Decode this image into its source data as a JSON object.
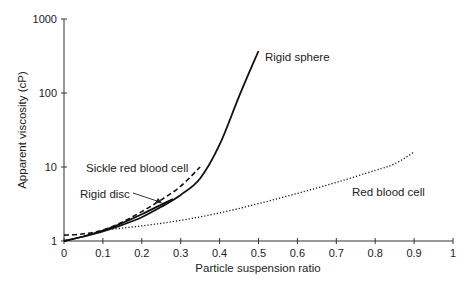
{
  "chart_data": {
    "type": "line",
    "title": "",
    "xlabel": "Particle suspension ratio",
    "ylabel": "Apparent viscosity (cP)",
    "xlim": [
      0,
      1
    ],
    "ylim": [
      1,
      1000
    ],
    "yscale": "log",
    "grid": false,
    "legend": "inline annotations",
    "x_ticks": [
      "0",
      "0.1",
      "0.2",
      "0.3",
      "0.4",
      "0.5",
      "0.6",
      "0.7",
      "0.8",
      "0.9",
      "1"
    ],
    "y_ticks": [
      "1",
      "10",
      "100",
      "1000"
    ],
    "series": [
      {
        "name": "Rigid sphere",
        "style": "solid",
        "x": [
          0,
          0.05,
          0.1,
          0.15,
          0.2,
          0.25,
          0.3,
          0.35,
          0.4,
          0.45,
          0.5
        ],
        "y": [
          1.0,
          1.15,
          1.35,
          1.65,
          2.1,
          2.9,
          4.2,
          7.0,
          20,
          90,
          370
        ]
      },
      {
        "name": "Rigid disc",
        "style": "solid",
        "x": [
          0,
          0.05,
          0.1,
          0.15,
          0.2,
          0.25,
          0.28
        ],
        "y": [
          1.0,
          1.15,
          1.38,
          1.75,
          2.3,
          3.1,
          3.7
        ]
      },
      {
        "name": "Sickle red blood cell",
        "style": "dashed",
        "x": [
          0,
          0.05,
          0.1,
          0.15,
          0.2,
          0.25,
          0.3,
          0.35
        ],
        "y": [
          1.2,
          1.25,
          1.4,
          1.8,
          2.5,
          3.6,
          5.5,
          10
        ]
      },
      {
        "name": "Red blood cell",
        "style": "dotted",
        "x": [
          0.1,
          0.2,
          0.3,
          0.4,
          0.5,
          0.6,
          0.7,
          0.8,
          0.85,
          0.9
        ],
        "y": [
          1.4,
          1.6,
          1.9,
          2.4,
          3.2,
          4.4,
          6.2,
          9.0,
          11,
          16
        ]
      }
    ],
    "annotations": [
      {
        "text": "Rigid sphere",
        "x": 0.52,
        "y": 330
      },
      {
        "text": "Sickle red blood cell",
        "x": 0.05,
        "y": 9
      },
      {
        "text": "Rigid disc",
        "x": 0.04,
        "y": 4.2,
        "arrow_to": [
          0.27,
          3.3
        ]
      },
      {
        "text": "Red blood cell",
        "x": 0.67,
        "y": 4.5
      }
    ]
  },
  "labels": {
    "xlabel": "Particle suspension ratio",
    "ylabel": "Apparent viscosity (cP)",
    "rigid_sphere": "Rigid sphere",
    "sickle": "Sickle red blood cell",
    "rigid_disc": "Rigid disc",
    "rbc": "Red blood cell"
  }
}
